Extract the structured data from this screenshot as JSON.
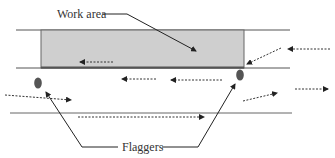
{
  "diagram": {
    "labels": {
      "work_area": "Work area",
      "flaggers": "Flaggers"
    },
    "colors": {
      "lane_line": "#555555",
      "work_area_fill": "#cfcfcf",
      "work_area_edge": "#666666",
      "flagger": "#555555",
      "arrow": "#222222",
      "text": "#333333"
    },
    "elements": {
      "lane_lines": [
        "top-edge",
        "work-zone-edge",
        "centerline"
      ],
      "flaggers_count": 2,
      "traffic_arrows": [
        {
          "id": "in-work-area-left",
          "direction": "left"
        },
        {
          "id": "upper-lane-left-1",
          "direction": "left"
        },
        {
          "id": "upper-lane-left-2",
          "direction": "left"
        },
        {
          "id": "entering-right-top",
          "direction": "left"
        },
        {
          "id": "diagonal-into-zone",
          "direction": "down-left"
        },
        {
          "id": "lower-left-in",
          "direction": "right"
        },
        {
          "id": "lower-lane-right",
          "direction": "right"
        },
        {
          "id": "exit-right-diagonal",
          "direction": "up-right"
        },
        {
          "id": "exit-right",
          "direction": "right"
        }
      ]
    }
  }
}
